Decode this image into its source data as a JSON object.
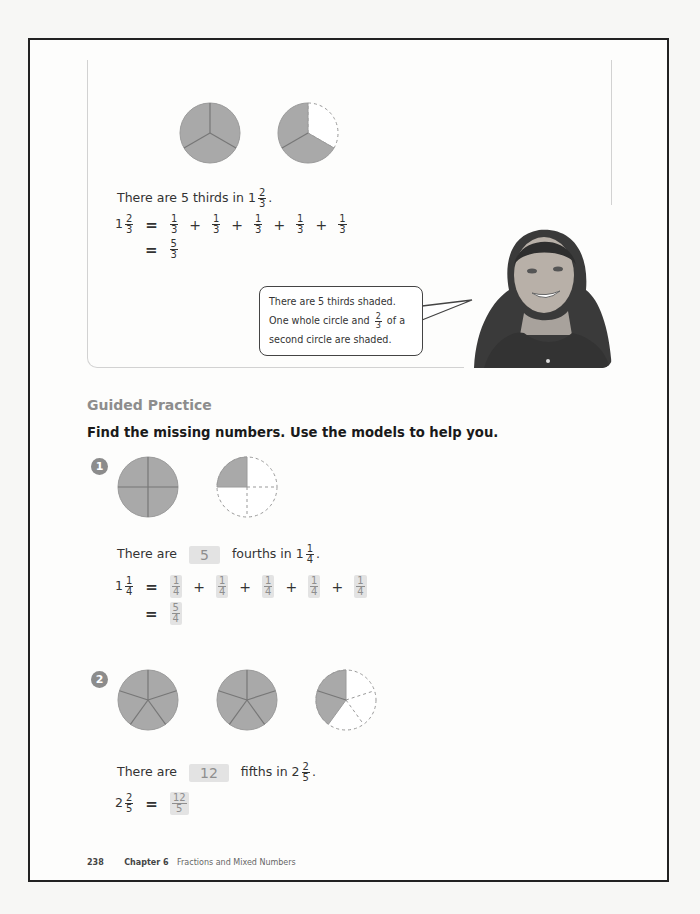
{
  "page": {
    "page_number": "238",
    "chapter_label": "Chapter 6",
    "chapter_title": "Fractions and Mixed Numbers"
  },
  "example": {
    "models": [
      {
        "parts": 3,
        "shaded": 3
      },
      {
        "parts": 3,
        "shaded": 2
      }
    ],
    "statement": {
      "prefix": "There are 5 thirds in",
      "whole": "1",
      "num": "2",
      "den": "3",
      "suffix": "."
    },
    "equation1": {
      "lhs": {
        "whole": "1",
        "num": "2",
        "den": "3"
      },
      "terms": [
        {
          "num": "1",
          "den": "3"
        },
        {
          "num": "1",
          "den": "3"
        },
        {
          "num": "1",
          "den": "3"
        },
        {
          "num": "1",
          "den": "3"
        },
        {
          "num": "1",
          "den": "3"
        }
      ],
      "plus": "+",
      "equals": "="
    },
    "equation2": {
      "equals": "=",
      "num": "5",
      "den": "3"
    },
    "speech_bubble": {
      "line1": "There are 5 thirds shaded.",
      "line2_prefix": "One whole circle and",
      "line2_num": "2",
      "line2_den": "3",
      "line2_suffix": "of a",
      "line3": "second circle are shaded."
    },
    "photo_alt": "smiling girl"
  },
  "guided_practice": {
    "title": "Guided Practice",
    "instruction": "Find the missing numbers. Use the models to help you.",
    "problems": [
      {
        "number": "1",
        "models": [
          {
            "parts": 4,
            "shaded": 4
          },
          {
            "parts": 4,
            "shaded": 1
          }
        ],
        "statement": {
          "prefix": "There are",
          "answer": "5",
          "middle": "fourths in",
          "whole": "1",
          "num": "1",
          "den": "4",
          "suffix": "."
        },
        "equation1": {
          "lhs": {
            "whole": "1",
            "num": "1",
            "den": "4"
          },
          "terms": [
            {
              "num": "1",
              "den": "4"
            },
            {
              "num": "1",
              "den": "4"
            },
            {
              "num": "1",
              "den": "4"
            },
            {
              "num": "1",
              "den": "4"
            },
            {
              "num": "1",
              "den": "4"
            }
          ],
          "plus": "+",
          "equals": "="
        },
        "equation2": {
          "equals": "=",
          "num": "5",
          "den": "4"
        }
      },
      {
        "number": "2",
        "models": [
          {
            "parts": 5,
            "shaded": 5
          },
          {
            "parts": 5,
            "shaded": 5
          },
          {
            "parts": 5,
            "shaded": 2
          }
        ],
        "statement": {
          "prefix": "There are",
          "answer": "12",
          "middle": "fifths in",
          "whole": "2",
          "num": "2",
          "den": "5",
          "suffix": "."
        },
        "equation1": {
          "lhs": {
            "whole": "2",
            "num": "2",
            "den": "5"
          },
          "equals": "=",
          "num": "12",
          "den": "5"
        }
      }
    ]
  },
  "colors": {
    "shade": "#a9a9a9",
    "answer_bg": "#e3e3e3",
    "answer_text": "#8e8e8e",
    "frame": "#222222"
  }
}
